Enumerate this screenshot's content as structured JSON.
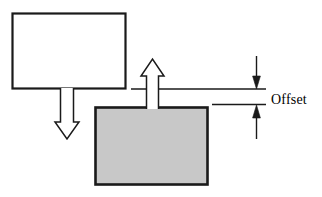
{
  "diagram": {
    "type": "technical-line-diagram",
    "background_color": "#ffffff",
    "stroke_color": "#1a1a1a",
    "fill_gray": "#c8c8c8",
    "labels": {
      "offset": "Offset"
    },
    "shapes": {
      "top_rectangle": {
        "name": "white-rectangle",
        "fill": "#ffffff",
        "stroke": "#1a1a1a",
        "x": 12,
        "y": 13,
        "width": 114,
        "height": 76
      },
      "bottom_rectangle": {
        "name": "gray-rectangle",
        "fill": "#c8c8c8",
        "stroke": "#1a1a1a",
        "x": 95,
        "y": 107,
        "width": 113,
        "height": 78
      },
      "down_arrow": {
        "name": "down-outline-arrow",
        "direction": "down",
        "fill": "#ffffff",
        "stroke": "#1a1a1a",
        "from_y": 89,
        "tip_y": 139,
        "center_x": 67
      },
      "up_arrow": {
        "name": "up-outline-arrow",
        "direction": "up",
        "fill": "#ffffff",
        "stroke": "#1a1a1a",
        "from_y": 108,
        "tip_y": 59,
        "center_x": 152
      }
    },
    "reference_lines": [
      {
        "name": "upper-reference-line",
        "x1": 131,
        "y": 89,
        "x2": 266
      },
      {
        "name": "lower-reference-line",
        "x1": 212,
        "y": 104,
        "x2": 266
      }
    ],
    "dimension": {
      "name": "offset-dimension",
      "x": 256,
      "upper_arrow": {
        "start_y": 56,
        "tip_y": 88
      },
      "lower_arrow": {
        "start_y": 139,
        "tip_y": 105
      }
    }
  }
}
